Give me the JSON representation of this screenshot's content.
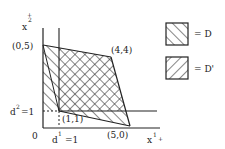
{
  "diagram": {
    "axes": {
      "x_label": "x",
      "x_superscript": "1",
      "x_arrow": "+",
      "y_label": "x",
      "y_superscript": "2",
      "y_arrow": "+",
      "origin_label": "0"
    },
    "points": [
      {
        "label": "(0,5)"
      },
      {
        "label": "(4,4)"
      },
      {
        "label": "(5,0)"
      },
      {
        "label": "(1,1)"
      }
    ],
    "threshold_lines": {
      "vertical": {
        "label": "d",
        "superscript": "1",
        "suffix": "=1"
      },
      "horizontal": {
        "label": "d",
        "superscript": "2",
        "suffix": "=1"
      }
    },
    "legend": [
      {
        "symbol": "hatch-forward",
        "text": "= D"
      },
      {
        "symbol": "hatch-backward",
        "text": "= D'"
      }
    ],
    "colors": {
      "ink": "#222222",
      "background": "#ffffff"
    }
  }
}
